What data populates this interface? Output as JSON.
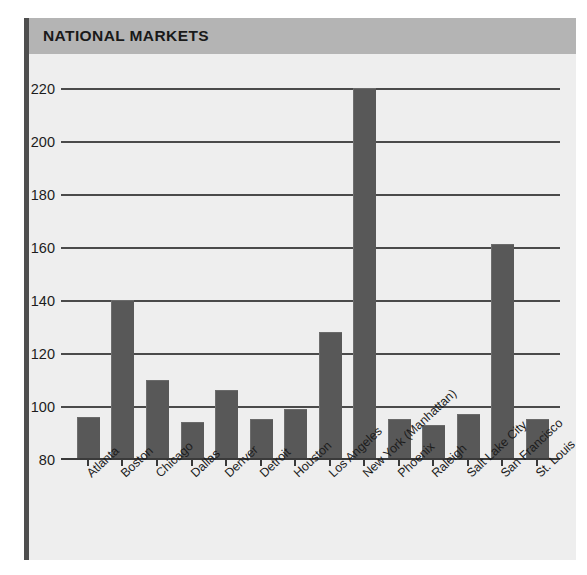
{
  "header": {
    "title": "NATIONAL MARKETS",
    "banner_color": "#b4b4b4",
    "rule_color": "#4e4e4e"
  },
  "chart_data": {
    "type": "bar",
    "title": "NATIONAL MARKETS",
    "xlabel": "",
    "ylabel": "",
    "categories": [
      "Atlanta",
      "Boston",
      "Chicago",
      "Dallas",
      "Denver",
      "Detroit",
      "Houston",
      "Los Angeles",
      "New York (Manhattan)",
      "Phoenix",
      "Raleigh",
      "Salt Lake City",
      "San Francisco",
      "St. Louis"
    ],
    "values": [
      96,
      140,
      110,
      94,
      106,
      95,
      99,
      128,
      220,
      95,
      93,
      97,
      161,
      95
    ],
    "ylim": [
      80,
      220
    ],
    "yticks": [
      80,
      100,
      120,
      140,
      160,
      180,
      200,
      220
    ],
    "ytick_labels": [
      "80",
      "100",
      "120",
      "140",
      "160",
      "180",
      "200",
      "220"
    ],
    "grid": true,
    "grid_axis": "y",
    "legend": false,
    "bar_color": "#585858",
    "plot_background": "#eeeeee",
    "label_rotation": -43
  }
}
